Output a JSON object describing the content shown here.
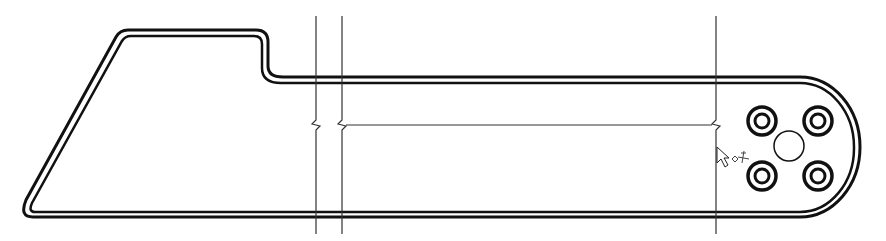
{
  "drawing": {
    "title": "Part outline with section break lines",
    "colors": {
      "stroke": "#111111",
      "background": "#ffffff",
      "thin": "#333333"
    },
    "outline": {
      "outer": "M 33 217 L 800 217 A 60 70 0 0 0 860 147 A 60 70 0 0 0 800 77 L 283 77 Q 268 77 268 66 L 268 42 Q 268 30 256 30 L 128 30 Q 120 30 116 37 L 26 200 Q 19 217 33 217 Z",
      "inner": "M 35 212 L 800 212 A 54 64 0 0 0 854 147 A 54 64 0 0 0 800 83 L 281 83 Q 262 83 262 68 L 262 44 Q 262 36 254 36 L 131 36 Q 125 36 122 41 L 32 203 Q 28 212 35 212 Z"
    },
    "section_lines": [
      {
        "name": "section-line-1",
        "x": 316,
        "y1": 16,
        "y2": 234
      },
      {
        "name": "section-line-2",
        "x": 342,
        "y1": 16,
        "y2": 234
      },
      {
        "name": "section-line-3",
        "x": 716,
        "y1": 16,
        "y2": 234
      }
    ],
    "dimension_line": {
      "x1": 342,
      "x2": 716,
      "y": 125
    },
    "holes": [
      {
        "name": "hole-top-left",
        "cx": 762,
        "cy": 121
      },
      {
        "name": "hole-top-right",
        "cx": 818,
        "cy": 121
      },
      {
        "name": "hole-bottom-left",
        "cx": 762,
        "cy": 176
      },
      {
        "name": "hole-bottom-right",
        "cx": 818,
        "cy": 176
      }
    ],
    "center_hole": {
      "cx": 789,
      "cy": 146,
      "r": 15
    },
    "cursor": {
      "x": 717,
      "y": 147
    }
  }
}
